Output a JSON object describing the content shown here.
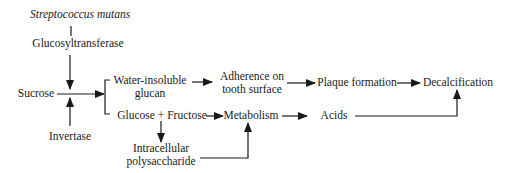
{
  "diagram": {
    "nodes": {
      "organism": {
        "label": "Streptococcus mutans"
      },
      "enzyme_gtf": {
        "label": "Glucosyltransferase"
      },
      "sucrose": {
        "label": "Sucrose"
      },
      "invertase": {
        "label": "Invertase"
      },
      "glucan": {
        "line1": "Water-insoluble",
        "line2": "glucan"
      },
      "glucose_fructose": {
        "label": "Glucose + Fructose"
      },
      "adherence": {
        "line1": "Adherence on",
        "line2": "tooth surface"
      },
      "metabolism": {
        "label": "Metabolism"
      },
      "intracellular": {
        "line1": "Intracellular",
        "line2": "polysaccharide"
      },
      "plaque": {
        "label": "Plaque formation"
      },
      "acids": {
        "label": "Acids"
      },
      "decalcification": {
        "label": "Decalcification"
      }
    },
    "edges": [
      {
        "from": "Streptococcus mutans",
        "to": "Glucosyltransferase",
        "type": "line"
      },
      {
        "from": "Glucosyltransferase",
        "to": "Sucrose",
        "type": "arrow"
      },
      {
        "from": "Invertase",
        "to": "Sucrose",
        "type": "arrow"
      },
      {
        "from": "Sucrose",
        "to": "Water-insoluble glucan / Glucose + Fructose",
        "type": "arrow-branch"
      },
      {
        "from": "Water-insoluble glucan",
        "to": "Adherence on tooth surface",
        "type": "arrow"
      },
      {
        "from": "Adherence on tooth surface",
        "to": "Plaque formation",
        "type": "arrow"
      },
      {
        "from": "Plaque formation",
        "to": "Decalcification",
        "type": "arrow"
      },
      {
        "from": "Glucose + Fructose",
        "to": "Metabolism",
        "type": "arrow"
      },
      {
        "from": "Glucose + Fructose",
        "to": "Intracellular polysaccharide",
        "type": "arrow"
      },
      {
        "from": "Intracellular polysaccharide",
        "to": "Metabolism",
        "type": "arrow"
      },
      {
        "from": "Metabolism",
        "to": "Acids",
        "type": "arrow"
      },
      {
        "from": "Acids",
        "to": "Decalcification",
        "type": "arrow"
      }
    ],
    "colors": {
      "line": "#1a1a1a",
      "text": "#1a1a1a",
      "background": "#ffffff"
    }
  }
}
